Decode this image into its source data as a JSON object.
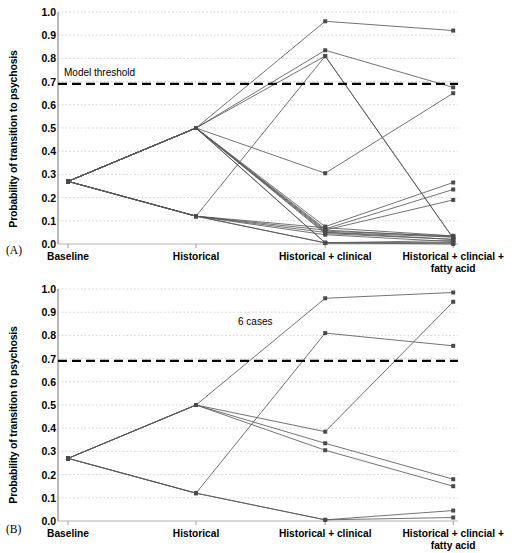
{
  "figure": {
    "panels": [
      {
        "letter": "(A)",
        "annotation": "Model threshold",
        "ylabel": "Probability of transition to psychosis"
      },
      {
        "letter": "(B)",
        "annotation": "6 cases",
        "ylabel": "Probability of transition to psychosis"
      }
    ]
  },
  "chart_data": [
    {
      "type": "line",
      "panel": "A",
      "title": "",
      "xlabel": "",
      "ylabel": "Probability of transition to psychosis",
      "categories": [
        "Baseline",
        "Historical",
        "Historical + clinical",
        "Historical + clincial +\nfatty acid"
      ],
      "ylim": [
        0.0,
        1.0
      ],
      "yticks": [
        "0.0",
        "0.1",
        "0.2",
        "0.3",
        "0.4",
        "0.5",
        "0.6",
        "0.7",
        "0.8",
        "0.9",
        "1.0"
      ],
      "grid": true,
      "legend": "none",
      "threshold": {
        "value": 0.69,
        "label": "Model threshold",
        "style": "dashed"
      },
      "series": [
        {
          "name": "case-1",
          "values": [
            0.27,
            0.5,
            0.96,
            0.92
          ]
        },
        {
          "name": "case-2",
          "values": [
            0.27,
            0.5,
            0.835,
            0.675
          ]
        },
        {
          "name": "case-3",
          "values": [
            0.27,
            0.5,
            0.81,
            0.025
          ]
        },
        {
          "name": "case-4",
          "values": [
            0.27,
            0.5,
            0.305,
            0.65
          ]
        },
        {
          "name": "case-5",
          "values": [
            0.27,
            0.5,
            0.075,
            0.265
          ]
        },
        {
          "name": "case-6",
          "values": [
            0.27,
            0.5,
            0.065,
            0.235
          ]
        },
        {
          "name": "case-7",
          "values": [
            0.27,
            0.5,
            0.06,
            0.19
          ]
        },
        {
          "name": "case-8",
          "values": [
            0.27,
            0.5,
            0.055,
            0.035
          ]
        },
        {
          "name": "case-9",
          "values": [
            0.27,
            0.5,
            0.05,
            0.03
          ]
        },
        {
          "name": "case-10",
          "values": [
            0.27,
            0.5,
            0.045,
            0.02
          ]
        },
        {
          "name": "case-11",
          "values": [
            0.27,
            0.5,
            0.005,
            0.015
          ]
        },
        {
          "name": "case-12",
          "values": [
            0.27,
            0.5,
            0.005,
            0.005
          ]
        },
        {
          "name": "case-13",
          "values": [
            0.27,
            0.12,
            0.81,
            0.025
          ]
        },
        {
          "name": "case-14",
          "values": [
            0.27,
            0.12,
            0.07,
            0.035
          ]
        },
        {
          "name": "case-15",
          "values": [
            0.27,
            0.12,
            0.06,
            0.03
          ]
        },
        {
          "name": "case-16",
          "values": [
            0.27,
            0.12,
            0.05,
            0.02
          ]
        },
        {
          "name": "case-17",
          "values": [
            0.27,
            0.12,
            0.04,
            0.01
          ]
        },
        {
          "name": "case-18",
          "values": [
            0.27,
            0.12,
            0.005,
            0.005
          ]
        },
        {
          "name": "case-19",
          "values": [
            0.27,
            0.12,
            0.005,
            0.0
          ]
        }
      ]
    },
    {
      "type": "line",
      "panel": "B",
      "title": "",
      "xlabel": "",
      "ylabel": "Probability of transition to psychosis",
      "categories": [
        "Baseline",
        "Historical",
        "Historical + clinical",
        "Historical + clincial +\nfatty acid"
      ],
      "ylim": [
        0.0,
        1.0
      ],
      "yticks": [
        "0.0",
        "0.1",
        "0.2",
        "0.3",
        "0.4",
        "0.5",
        "0.6",
        "0.7",
        "0.8",
        "0.9",
        "1.0"
      ],
      "grid": true,
      "legend": "none",
      "threshold": {
        "value": 0.69,
        "label": "",
        "style": "dashed"
      },
      "annotation": {
        "text": "6 cases",
        "x_category": "Historical + clinical",
        "y": 0.855
      },
      "series": [
        {
          "name": "case-1",
          "values": [
            0.27,
            0.5,
            0.96,
            0.985
          ]
        },
        {
          "name": "case-2",
          "values": [
            0.27,
            0.5,
            0.385,
            0.945
          ]
        },
        {
          "name": "case-3",
          "values": [
            0.27,
            0.5,
            0.335,
            0.18
          ]
        },
        {
          "name": "case-4",
          "values": [
            0.27,
            0.5,
            0.305,
            0.15
          ]
        },
        {
          "name": "case-5",
          "values": [
            0.27,
            0.12,
            0.81,
            0.755
          ]
        },
        {
          "name": "case-6",
          "values": [
            0.27,
            0.12,
            0.005,
            0.045
          ]
        },
        {
          "name": "case-7",
          "values": [
            0.27,
            0.12,
            0.005,
            0.015
          ]
        }
      ]
    }
  ]
}
